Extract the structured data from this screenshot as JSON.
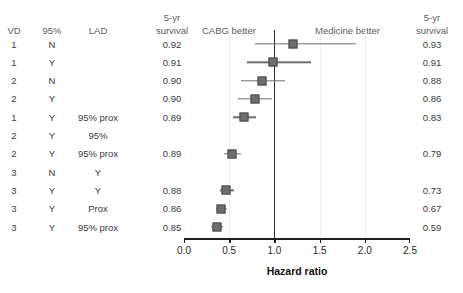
{
  "chart_data": {
    "type": "forest",
    "title": "",
    "xlabel": "Hazard ratio",
    "ylabel": "",
    "xlim": [
      0.0,
      2.5
    ],
    "xticks": [
      "0.0",
      "0.5",
      "1.0",
      "1.5",
      "2.0",
      "2.5"
    ],
    "xtick_values": [
      0.0,
      0.5,
      1.0,
      1.5,
      2.0,
      2.5
    ],
    "grid": true,
    "null_line": 1.0,
    "left_region_label": "CABG better",
    "right_region_label": "Medicine better",
    "columns": [
      "VD",
      "95%",
      "LAD",
      "5-yr survival",
      "",
      "5-yr survival"
    ],
    "column_headers": {
      "vd": "VD",
      "pct95": "95%",
      "lad": "LAD",
      "survival_left_line1": "5-yr",
      "survival_left_line2": "survival",
      "survival_right_line1": "5-yr",
      "survival_right_line2": "survival"
    },
    "rows": [
      {
        "vd": "1",
        "pct95": "N",
        "lad": "",
        "survival_left": "0.92",
        "survival_right": "0.93",
        "hr": 1.21,
        "ci_low": 0.79,
        "ci_high": 1.9,
        "marker_size": 9
      },
      {
        "vd": "1",
        "pct95": "Y",
        "lad": "",
        "survival_left": "0.91",
        "survival_right": "0.91",
        "hr": 0.98,
        "ci_low": 0.7,
        "ci_high": 1.4,
        "marker_size": 9
      },
      {
        "vd": "2",
        "pct95": "N",
        "lad": "",
        "survival_left": "0.90",
        "survival_right": "0.88",
        "hr": 0.86,
        "ci_low": 0.63,
        "ci_high": 1.12,
        "marker_size": 9
      },
      {
        "vd": "2",
        "pct95": "Y",
        "lad": "",
        "survival_left": "0.90",
        "survival_right": "0.86",
        "hr": 0.79,
        "ci_low": 0.6,
        "ci_high": 0.97,
        "marker_size": 9
      },
      {
        "vd": "1",
        "pct95": "Y",
        "lad": "95% prox",
        "survival_left": "0.89",
        "survival_right": "0.83",
        "hr": 0.66,
        "ci_low": 0.54,
        "ci_high": 0.8,
        "marker_size": 9
      },
      {
        "vd": "2",
        "pct95": "Y",
        "lad": "95%",
        "survival_left": "",
        "survival_right": "",
        "hr": null,
        "ci_low": null,
        "ci_high": null,
        "marker_size": 0
      },
      {
        "vd": "2",
        "pct95": "Y",
        "lad": "95% prox",
        "survival_left": "0.89",
        "survival_right": "0.79",
        "hr": 0.53,
        "ci_low": 0.44,
        "ci_high": 0.63,
        "marker_size": 9
      },
      {
        "vd": "3",
        "pct95": "N",
        "lad": "Y",
        "survival_left": "",
        "survival_right": "",
        "hr": null,
        "ci_low": null,
        "ci_high": null,
        "marker_size": 0
      },
      {
        "vd": "3",
        "pct95": "Y",
        "lad": "Y",
        "survival_left": "0.88",
        "survival_right": "0.73",
        "hr": 0.47,
        "ci_low": 0.4,
        "ci_high": 0.55,
        "marker_size": 9
      },
      {
        "vd": "3",
        "pct95": "Y",
        "lad": "Prox",
        "survival_left": "0.86",
        "survival_right": "0.67",
        "hr": 0.41,
        "ci_low": 0.35,
        "ci_high": 0.48,
        "marker_size": 9
      },
      {
        "vd": "3",
        "pct95": "Y",
        "lad": "95% prox",
        "survival_left": "0.85",
        "survival_right": "0.59",
        "hr": 0.36,
        "ci_low": 0.3,
        "ci_high": 0.43,
        "marker_size": 9
      }
    ],
    "colors": {
      "marker_fill": "#6e6e6e",
      "marker_edge": "#4a4a4a",
      "ci_line": "#6e6e6e",
      "null_line": "#2b2b2b",
      "gridline": "#ededed",
      "axis": "#1f1f1f",
      "header_text": "#5d5d5d",
      "body_text": "#3a3a3a"
    }
  }
}
